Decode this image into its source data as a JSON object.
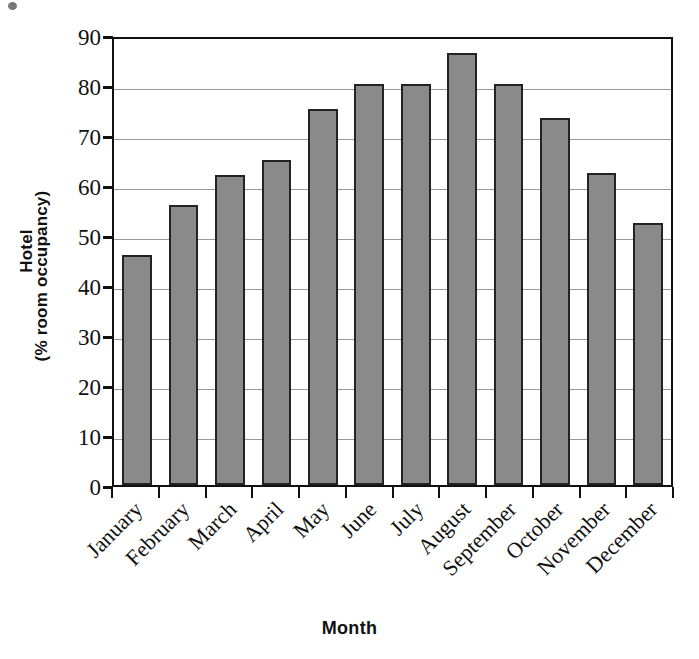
{
  "chart_data": {
    "type": "bar",
    "title": "",
    "xlabel": "Month",
    "ylabel": "Hotel (% room occupancy)",
    "ylabel_lines": [
      "Hotel",
      "(% room occupancy)"
    ],
    "categories": [
      "January",
      "February",
      "March",
      "April",
      "May",
      "June",
      "July",
      "August",
      "September",
      "October",
      "November",
      "December"
    ],
    "values": [
      46,
      56,
      62,
      65,
      75.2,
      80.3,
      80.3,
      86.5,
      80.3,
      73.5,
      62.5,
      52.5
    ],
    "ylim": [
      0,
      90
    ],
    "ytick_values": [
      0,
      10,
      20,
      30,
      40,
      50,
      60,
      70,
      80,
      90
    ],
    "ytick_labels": [
      "0",
      "10",
      "20",
      "30",
      "40",
      "50",
      "60",
      "70",
      "80",
      "90"
    ],
    "grid": true,
    "legend": false,
    "legend_position": "none",
    "bar_color": "#8a8a8a",
    "bar_border_color": "#232323",
    "gridline_color": "#9a9a9a",
    "axis_color": "#111111",
    "background_color": "#ffffff"
  }
}
